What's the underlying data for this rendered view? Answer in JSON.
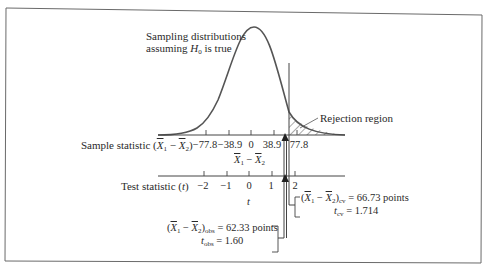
{
  "figure": {
    "curve_label_line1": "Sampling distributions",
    "curve_label_line2_prefix": "assuming ",
    "curve_label_line2_var": "H",
    "curve_label_line2_sub": "0",
    "curve_label_line2_suffix": " is true",
    "rejection_label": "Rejection region",
    "sample_axis": {
      "label_prefix": "Sample statistic (",
      "label_x1": "X",
      "label_sub1": "1",
      "label_minus": " − ",
      "label_x2": "X",
      "label_sub2": "2",
      "label_suffix": ")",
      "ticks": [
        "−77.8",
        "−38.9",
        "0",
        "38.9",
        "77.8"
      ],
      "axis_name_x1": "X",
      "axis_name_sub1": "1",
      "axis_name_minus": " − ",
      "axis_name_x2": "X",
      "axis_name_sub2": "2"
    },
    "test_axis": {
      "label_prefix": "Test statistic (",
      "label_var": "t",
      "label_suffix": ")",
      "ticks": [
        "−2",
        "−1",
        "0",
        "1",
        "2"
      ],
      "axis_name": "t"
    },
    "critical": {
      "diff_open": "(",
      "x1": "X",
      "sub1": "1",
      "minus": " − ",
      "x2": "X",
      "sub2": "2",
      "close": ")",
      "sub_cv": "cv",
      "diff_value": " = 66.73 points",
      "t_var": "t",
      "t_sub": "cv",
      "t_value": " = 1.714"
    },
    "observed": {
      "diff_open": "(",
      "x1": "X",
      "sub1": "1",
      "minus": " − ",
      "x2": "X",
      "sub2": "2",
      "close": ")",
      "sub_obs": "obs",
      "diff_value": " = 62.33 points",
      "t_var": "t",
      "t_sub": "obs",
      "t_value": " = 1.60"
    }
  }
}
